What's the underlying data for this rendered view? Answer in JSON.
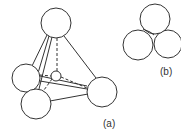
{
  "figure": {
    "labels": {
      "a": "(a)",
      "b": "(b)"
    },
    "colors": {
      "stroke": "#333333",
      "fill": "#ffffff"
    },
    "a_tetrahedron": {
      "description": "Tetrahedral site: four large spheres at tetrahedron vertices with small interstitial sphere at centre",
      "spheres": [
        {
          "name": "top",
          "cx": 56,
          "cy": 23,
          "r": 15
        },
        {
          "name": "left",
          "cx": 26,
          "cy": 78,
          "r": 14
        },
        {
          "name": "front",
          "cx": 36,
          "cy": 104,
          "r": 15
        },
        {
          "name": "right",
          "cx": 102,
          "cy": 92,
          "r": 15
        }
      ],
      "interstitial": {
        "cx": 56,
        "cy": 76,
        "r": 5
      }
    },
    "b_packed": {
      "description": "Four close-packed spheres forming tetrahedral void",
      "spheres": [
        {
          "cx": 155,
          "cy": 19,
          "r": 15
        },
        {
          "cx": 168,
          "cy": 44,
          "r": 14
        },
        {
          "cx": 138,
          "cy": 45,
          "r": 15
        }
      ]
    }
  }
}
